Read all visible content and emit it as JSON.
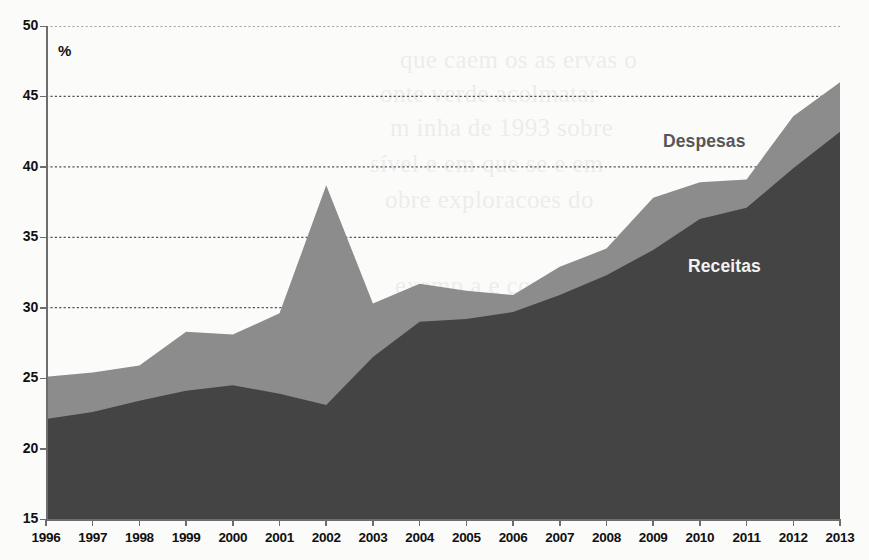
{
  "chart_data": {
    "type": "area",
    "title": "",
    "subtitle": "",
    "xlabel": "",
    "ylabel": "%",
    "unit_label": "%",
    "xlim": [
      1996,
      2013
    ],
    "ylim": [
      15,
      50
    ],
    "y_ticks": [
      50,
      45,
      40,
      35,
      30,
      25,
      20,
      15
    ],
    "grid": true,
    "grid_style": "dotted-horizontal",
    "legend_position": "inline-annotation",
    "categories": [
      1996,
      1997,
      1998,
      1999,
      2000,
      2001,
      2002,
      2003,
      2004,
      2005,
      2006,
      2007,
      2008,
      2009,
      2010,
      2011,
      2012,
      2013
    ],
    "x_tick_labels": [
      "1996",
      "1997",
      "1998",
      "1999",
      "2000",
      "2001",
      "2002",
      "2003",
      "2004",
      "2005",
      "2006",
      "2007",
      "2008",
      "2009",
      "2010",
      "2011",
      "2012",
      "2013"
    ],
    "series": [
      {
        "name": "Despesas",
        "color": "#8c8c8c",
        "label_color": "#565656",
        "values": [
          25.1,
          25.4,
          25.9,
          28.3,
          28.1,
          29.6,
          38.7,
          30.3,
          31.7,
          31.2,
          30.9,
          32.9,
          34.2,
          37.8,
          38.9,
          39.1,
          43.6,
          46.0
        ]
      },
      {
        "name": "Receitas",
        "color": "#444444",
        "label_color": "#f2f2f2",
        "values": [
          22.1,
          22.6,
          23.4,
          24.1,
          24.5,
          23.9,
          23.1,
          26.5,
          29.0,
          29.2,
          29.7,
          30.9,
          32.3,
          34.1,
          36.3,
          37.1,
          39.9,
          42.5
        ]
      }
    ],
    "annotations": [
      {
        "text": "Despesas",
        "x": 2009.6,
        "y": 41.4
      },
      {
        "text": "Receitas",
        "x": 2010.2,
        "y": 32.5
      }
    ]
  },
  "background_bleed": [
    "que caem os as ervas o",
    "onte verde acolmatar",
    "m inha de 1993 sobre",
    "sível e em que se e em",
    "obre exploracoes do",
    "exemp a e conjunta",
    "e praticamente a vez, adiamento"
  ],
  "colors": {
    "despesas_fill": "#8c8c8c",
    "receitas_fill": "#444444",
    "axis": "#6d6d6d",
    "gridline": "#555555",
    "page_background": "#fbfbfa",
    "tick_text": "#111111"
  }
}
